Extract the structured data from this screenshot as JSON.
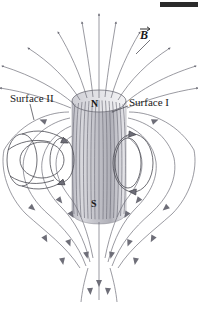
{
  "figure": {
    "kind": "magnetic-field-lines-bar-magnet",
    "background_color": "#ffffff",
    "line_color": "#6e6e78",
    "magnet_fill_light": "#e8e8ea",
    "magnet_fill_mid": "#c9c9cf",
    "magnet_fill_dark": "#a9a9b2",
    "text_color": "#1a1a1a"
  },
  "labels": {
    "surface_1": "Surface I",
    "surface_2": "Surface II",
    "pole_north": "N",
    "pole_south": "S",
    "field_vector": "B"
  },
  "magnet": {
    "shape": "cylinder",
    "center_x": 99,
    "top_y": 96,
    "bottom_y": 218,
    "half_width": 27,
    "cap_ry": 11
  },
  "surfaces": [
    {
      "name": "Surface I",
      "type": "closed-ellipse",
      "side": "right",
      "cx": 133,
      "cy": 163,
      "rx": 20,
      "ry": 29
    },
    {
      "name": "Surface II",
      "type": "open-tube",
      "side": "left",
      "cx": 48,
      "cy": 162
    }
  ],
  "field_lines": {
    "count_outer": 14,
    "count_inner": 18,
    "arrow_direction_outside": "north-to-south-through-space",
    "arrow_direction_inside": "south-to-north-through-magnet"
  },
  "marker": {
    "top_right_bar_color": "#2b2b2b"
  }
}
